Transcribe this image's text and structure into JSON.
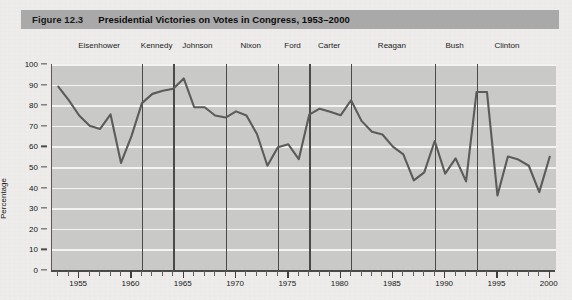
{
  "figure": {
    "number": "Figure 12.3",
    "title": "Presidential Victories on Votes in Congress, 1953–2000"
  },
  "chart_data": {
    "type": "line",
    "title": "Presidential Victories on Votes in Congress, 1953–2000",
    "xlabel": "",
    "ylabel": "Percentage",
    "xlim": [
      1952.4,
      2000.6
    ],
    "ylim": [
      0,
      100
    ],
    "grid": true,
    "legend": "none",
    "x": [
      1953,
      1954,
      1955,
      1956,
      1957,
      1958,
      1959,
      1960,
      1961,
      1962,
      1963,
      1964,
      1965,
      1966,
      1967,
      1968,
      1969,
      1970,
      1971,
      1972,
      1973,
      1974,
      1975,
      1976,
      1977,
      1978,
      1979,
      1980,
      1981,
      1982,
      1983,
      1984,
      1985,
      1986,
      1987,
      1988,
      1989,
      1990,
      1991,
      1992,
      1993,
      1994,
      1995,
      1996,
      1997,
      1998,
      1999,
      2000
    ],
    "values": [
      89.0,
      82.5,
      75.0,
      70.0,
      68.5,
      75.5,
      52.0,
      65.0,
      81.0,
      85.5,
      87.0,
      88.0,
      93.0,
      79.0,
      79.0,
      75.0,
      74.0,
      77.0,
      75.0,
      66.0,
      50.6,
      59.6,
      61.0,
      53.8,
      75.4,
      78.3,
      76.8,
      75.1,
      82.4,
      72.4,
      67.1,
      65.8,
      59.9,
      56.1,
      43.5,
      47.4,
      62.6,
      46.8,
      54.2,
      43.0,
      86.4,
      86.4,
      36.2,
      55.1,
      53.6,
      50.6,
      37.8,
      55.0
    ],
    "y_ticks": [
      0,
      10,
      20,
      30,
      40,
      50,
      60,
      70,
      80,
      90,
      100
    ],
    "x_tick_labels": [
      1955,
      1960,
      1965,
      1970,
      1975,
      1980,
      1985,
      1990,
      1995,
      2000
    ],
    "x_tick_step": 1,
    "colors": {
      "plot_background": "#c9c9c7",
      "gridline": "#f3f3f1",
      "series_line": "#5b5b5b",
      "divider": "#4a4a4a",
      "axis": "#4a4a4a",
      "title_bar": "#a9a9a9",
      "page_background": "#efeeec"
    },
    "annotations": [
      {
        "label": "Eisenhower",
        "start_year": 1953,
        "end_year": 1961,
        "label_year": 1957.0
      },
      {
        "label": "Kennedy",
        "start_year": 1961,
        "end_year": 1964,
        "label_year": 1962.5
      },
      {
        "label": "Johnson",
        "start_year": 1964,
        "end_year": 1969,
        "label_year": 1966.4
      },
      {
        "label": "Nixon",
        "start_year": 1969,
        "end_year": 1974,
        "label_year": 1971.5
      },
      {
        "label": "Ford",
        "start_year": 1974,
        "end_year": 1977,
        "label_year": 1975.5
      },
      {
        "label": "Carter",
        "start_year": 1977,
        "end_year": 1981,
        "label_year": 1979.0
      },
      {
        "label": "Reagan",
        "start_year": 1981,
        "end_year": 1989,
        "label_year": 1985.0
      },
      {
        "label": "Bush",
        "start_year": 1989,
        "end_year": 1993,
        "label_year": 1991.0
      },
      {
        "label": "Clinton",
        "start_year": 1993,
        "end_year": 2000,
        "label_year": 1996.0
      }
    ]
  }
}
